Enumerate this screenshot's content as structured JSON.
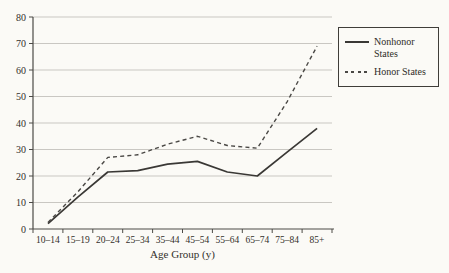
{
  "chart_data": {
    "type": "line",
    "title": "",
    "xlabel": "Age Group (y)",
    "ylabel": "",
    "ylim": [
      0,
      80
    ],
    "ytick_step": 10,
    "grid": true,
    "legend_position": "top-right",
    "categories": [
      "10–14",
      "15–19",
      "20–24",
      "25–34",
      "35–44",
      "45–54",
      "55–64",
      "65–74",
      "75–84",
      "85+"
    ],
    "series": [
      {
        "name": "Nonhonor States",
        "style": "solid",
        "values": [
          2,
          12,
          21.5,
          22,
          24.5,
          25.5,
          21.5,
          20,
          29,
          38
        ]
      },
      {
        "name": "Honor States",
        "style": "dashed",
        "values": [
          2.5,
          14,
          27,
          28,
          32,
          35,
          31.5,
          30.5,
          48,
          69
        ]
      }
    ]
  },
  "colors": {
    "background": "#fbfaf6",
    "solid_line": "#3a3835",
    "dashed_line": "#4a4845",
    "grid": "#c9c7c2",
    "axis": "#4c4a46",
    "text": "#33302b",
    "legend_border": "#3f3d39"
  }
}
